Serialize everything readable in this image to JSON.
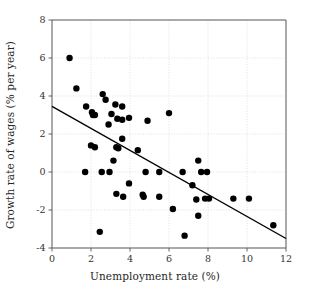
{
  "chart_data": {
    "type": "scatter",
    "title": "",
    "xlabel": "Unemployment rate (%)",
    "ylabel": "Growth rate of wages (% per year)",
    "xlim": [
      0,
      12
    ],
    "ylim": [
      -4,
      8
    ],
    "xticks": [
      0,
      2,
      4,
      6,
      8,
      10,
      12
    ],
    "yticks": [
      -4,
      -2,
      0,
      2,
      4,
      6,
      8
    ],
    "xtick_labels": [
      "0",
      "2",
      "4",
      "6",
      "8",
      "10",
      "12"
    ],
    "ytick_labels": [
      "-4",
      "-2",
      "0",
      "2",
      "4",
      "6",
      "8"
    ],
    "grid": true,
    "grid_style": "dotted",
    "grid_color": "#d9d9d9",
    "legend": null,
    "marker_color": "#000000",
    "marker_size": 3.2,
    "points": [
      {
        "x": 0.9,
        "y": 6.0
      },
      {
        "x": 1.25,
        "y": 4.4
      },
      {
        "x": 2.6,
        "y": 4.1
      },
      {
        "x": 2.75,
        "y": 3.8
      },
      {
        "x": 1.75,
        "y": 3.45
      },
      {
        "x": 3.25,
        "y": 3.55
      },
      {
        "x": 3.6,
        "y": 3.45
      },
      {
        "x": 6.0,
        "y": 3.1
      },
      {
        "x": 2.05,
        "y": 3.15
      },
      {
        "x": 2.1,
        "y": 3.0
      },
      {
        "x": 2.2,
        "y": 3.0
      },
      {
        "x": 3.05,
        "y": 3.05
      },
      {
        "x": 3.35,
        "y": 2.8
      },
      {
        "x": 3.6,
        "y": 2.75
      },
      {
        "x": 3.95,
        "y": 2.85
      },
      {
        "x": 4.9,
        "y": 2.7
      },
      {
        "x": 2.9,
        "y": 2.5
      },
      {
        "x": 3.6,
        "y": 1.75
      },
      {
        "x": 2.0,
        "y": 1.4
      },
      {
        "x": 2.2,
        "y": 1.3
      },
      {
        "x": 3.3,
        "y": 1.3
      },
      {
        "x": 3.4,
        "y": 1.25
      },
      {
        "x": 4.4,
        "y": 1.15
      },
      {
        "x": 3.15,
        "y": 0.6
      },
      {
        "x": 7.5,
        "y": 0.6
      },
      {
        "x": 1.7,
        "y": 0.0
      },
      {
        "x": 2.55,
        "y": 0.0
      },
      {
        "x": 2.95,
        "y": 0.0
      },
      {
        "x": 4.8,
        "y": 0.0
      },
      {
        "x": 5.5,
        "y": 0.0
      },
      {
        "x": 6.7,
        "y": 0.0
      },
      {
        "x": 7.65,
        "y": 0.0
      },
      {
        "x": 7.95,
        "y": 0.0
      },
      {
        "x": 3.95,
        "y": -0.6
      },
      {
        "x": 7.2,
        "y": -0.7
      },
      {
        "x": 3.3,
        "y": -1.15
      },
      {
        "x": 3.65,
        "y": -1.3
      },
      {
        "x": 4.65,
        "y": -1.2
      },
      {
        "x": 4.7,
        "y": -1.3
      },
      {
        "x": 5.5,
        "y": -1.3
      },
      {
        "x": 7.4,
        "y": -1.45
      },
      {
        "x": 7.85,
        "y": -1.4
      },
      {
        "x": 8.05,
        "y": -1.4
      },
      {
        "x": 9.3,
        "y": -1.4
      },
      {
        "x": 10.1,
        "y": -1.4
      },
      {
        "x": 6.2,
        "y": -1.95
      },
      {
        "x": 7.5,
        "y": -2.3
      },
      {
        "x": 11.35,
        "y": -2.8
      },
      {
        "x": 2.45,
        "y": -3.15
      },
      {
        "x": 6.8,
        "y": -3.35
      }
    ],
    "trend_line": {
      "type": "line",
      "color": "#000000",
      "x_start": 0.0,
      "y_start": 3.45,
      "x_end": 12.0,
      "y_end": -3.5
    }
  }
}
